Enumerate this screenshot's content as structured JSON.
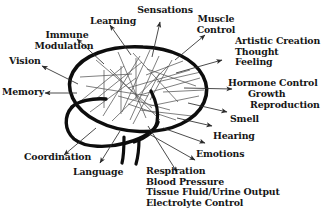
{
  "figure": {
    "colors": {
      "outline": "#0d0d0d",
      "neural_lines": "#4c4c4c",
      "arrows": "#2b2b2b",
      "text": "#161616",
      "background": "#ffffff"
    }
  },
  "brain": {
    "cerebrum_label": "cerebrum-outline",
    "cerebellum_label": "cerebellum-outline",
    "brainstem_label": "brainstem-outline"
  },
  "labels": {
    "learning": "Learning",
    "sensations": "Sensations",
    "immune": "Immune",
    "modulation": "Modulation",
    "muscle": "Muscle",
    "control": "Control",
    "vision": "Vision",
    "memory": "Memory",
    "artistic_creation": "Artistic Creation",
    "thought": "Thought",
    "feeling": "Feeling",
    "hormone_control": "Hormone Control",
    "growth": "Growth",
    "reproduction": "Reproduction",
    "smell": "Smell",
    "hearing": "Hearing",
    "emotions": "Emotions",
    "coordination": "Coordination",
    "language": "Language",
    "respiration": "Respiration",
    "blood_pressure": "Blood Pressure",
    "tissue_fluid": "Tissue Fluid/Urine Output",
    "electrolyte_control": "Electrolyte Control"
  }
}
